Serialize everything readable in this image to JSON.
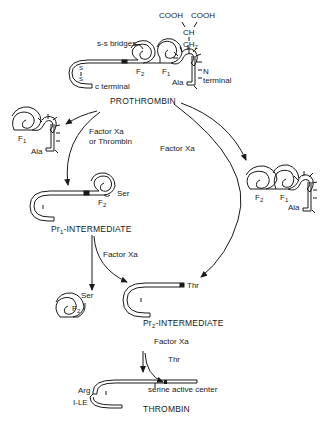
{
  "diagram": {
    "top": {
      "name": "PROTHROMBIN",
      "cooh_left": "COOH",
      "cooh_right": "COOH",
      "ch": "CH",
      "ch2": "CH",
      "ch2_sub": "2",
      "ss_bridges": "s-s bridges",
      "f2": "F",
      "f2_sub": "2",
      "f1": "F",
      "f1_sub": "1",
      "n_terminal_1": "N",
      "n_terminal_2": "terminal",
      "c_terminal": "c terminal",
      "ala": "Ala",
      "s_top": "S",
      "s_mid": "|",
      "s_bot": "S"
    },
    "left_fragment": {
      "f1": "F",
      "f1_sub": "1",
      "ala": "Ala"
    },
    "right_fragment": {
      "f2": "F",
      "f2_sub": "2",
      "f1": "F",
      "f1_sub": "1",
      "ala": "Ala"
    },
    "arrows": {
      "factor_xa_or_thrombin_1": "Factor Xa",
      "factor_xa_or_thrombin_2": "or Thrombin",
      "factor_xa_center": "Factor Xa",
      "factor_xa_pr1": "Factor Xa",
      "factor_xa_pr2": "Factor Xa"
    },
    "pr1": {
      "prefix": "Pr",
      "sub": "1",
      "suffix": "-INTERMEDIATE",
      "ser": "Ser",
      "f2": "F",
      "f2_sub": "2"
    },
    "pr1_products": {
      "ser": "Ser",
      "f2": "F",
      "f2_sub": "2",
      "thr": "Thr"
    },
    "pr2": {
      "prefix": "Pr",
      "sub": "2",
      "suffix": "-INTERMEDIATE",
      "thr": "Thr"
    },
    "thrombin": {
      "name": "THROMBIN",
      "arg": "Arg",
      "ile": "I-LE",
      "serine_active_center": "serine active center"
    }
  }
}
